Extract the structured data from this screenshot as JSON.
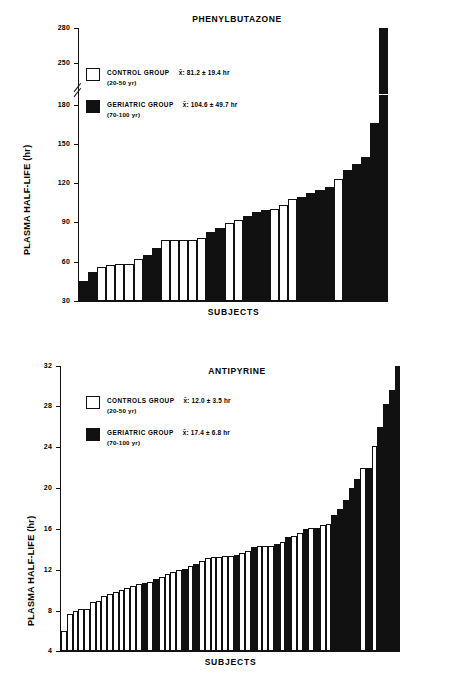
{
  "chart_data": [
    {
      "id": "phenylbutazone",
      "type": "bar",
      "title": "PHENYLBUTAZONE",
      "xlabel": "SUBJECTS",
      "ylabel": "PLASMA HALF-LIFE (hr)",
      "ylim": [
        30,
        280
      ],
      "axis_break": {
        "from": 180,
        "to": 250
      },
      "yticks": [
        30,
        60,
        90,
        120,
        150,
        180,
        250,
        280
      ],
      "ytick_labels": [
        "30",
        "60",
        "90",
        "120",
        "150",
        "180",
        "250",
        "280"
      ],
      "grid": false,
      "legend": {
        "position": "upper-left",
        "entries": [
          {
            "key": "control",
            "label": "CONTROL GROUP",
            "stat": "x̄: 81.2  ±  19.4 hr",
            "sub": "(20-50 yr)",
            "color": "#ffffff",
            "mean": 81.2,
            "sd": 19.4,
            "age_range": "20-50 yr"
          },
          {
            "key": "geriatric",
            "label": "GERIATRIC GROUP",
            "stat": "x̄: 104.6  ±  49.7 hr",
            "sub": "(70-100 yr)",
            "color": "#111111",
            "mean": 104.6,
            "sd": 49.7,
            "age_range": "70-100 yr"
          }
        ]
      },
      "bars": [
        {
          "value": 45,
          "group": "geriatric"
        },
        {
          "value": 52,
          "group": "geriatric"
        },
        {
          "value": 56,
          "group": "control"
        },
        {
          "value": 57,
          "group": "control"
        },
        {
          "value": 58,
          "group": "control"
        },
        {
          "value": 58,
          "group": "control"
        },
        {
          "value": 62,
          "group": "control"
        },
        {
          "value": 65,
          "group": "geriatric"
        },
        {
          "value": 70,
          "group": "geriatric"
        },
        {
          "value": 76,
          "group": "control"
        },
        {
          "value": 76,
          "group": "control"
        },
        {
          "value": 76,
          "group": "control"
        },
        {
          "value": 76,
          "group": "control"
        },
        {
          "value": 78,
          "group": "control"
        },
        {
          "value": 82,
          "group": "geriatric"
        },
        {
          "value": 85,
          "group": "geriatric"
        },
        {
          "value": 89,
          "group": "control"
        },
        {
          "value": 91,
          "group": "control"
        },
        {
          "value": 94,
          "group": "geriatric"
        },
        {
          "value": 97,
          "group": "geriatric"
        },
        {
          "value": 99,
          "group": "geriatric"
        },
        {
          "value": 100,
          "group": "control"
        },
        {
          "value": 103,
          "group": "control"
        },
        {
          "value": 107,
          "group": "control"
        },
        {
          "value": 109,
          "group": "geriatric"
        },
        {
          "value": 112,
          "group": "geriatric"
        },
        {
          "value": 114,
          "group": "geriatric"
        },
        {
          "value": 116,
          "group": "geriatric"
        },
        {
          "value": 122,
          "group": "control"
        },
        {
          "value": 129,
          "group": "geriatric"
        },
        {
          "value": 134,
          "group": "geriatric"
        },
        {
          "value": 139,
          "group": "geriatric"
        },
        {
          "value": 165,
          "group": "geriatric"
        },
        {
          "value": 280,
          "group": "geriatric",
          "broken": true
        }
      ]
    },
    {
      "id": "antipyrine",
      "type": "bar",
      "title": "ANTIPYRINE",
      "xlabel": "SUBJECTS",
      "ylabel": "PLASMA HALF-LIFE (hr)",
      "ylim": [
        4,
        32
      ],
      "yticks": [
        4,
        8,
        12,
        16,
        20,
        24,
        28,
        32
      ],
      "ytick_labels": [
        "4",
        "8",
        "12",
        "16",
        "20",
        "24",
        "28",
        "32"
      ],
      "grid": false,
      "legend": {
        "position": "upper-left",
        "entries": [
          {
            "key": "control",
            "label": "CONTROLS GROUP",
            "stat": "x̄: 12.0  ±  3.5 hr",
            "sub": "(20-50 yr)",
            "color": "#ffffff",
            "mean": 12.0,
            "sd": 3.5,
            "age_range": "20-50 yr"
          },
          {
            "key": "geriatric",
            "label": "GERIATRIC GROUP",
            "stat": "x̄: 17.4  ±  6.8 hr",
            "sub": "(70-100 yr)",
            "color": "#111111",
            "mean": 17.4,
            "sd": 6.8,
            "age_range": "70-100 yr"
          }
        ]
      },
      "bars": [
        {
          "value": 6.0,
          "group": "control"
        },
        {
          "value": 7.6,
          "group": "control"
        },
        {
          "value": 7.9,
          "group": "control"
        },
        {
          "value": 8.1,
          "group": "control"
        },
        {
          "value": 8.1,
          "group": "control"
        },
        {
          "value": 8.8,
          "group": "control"
        },
        {
          "value": 8.9,
          "group": "control"
        },
        {
          "value": 9.4,
          "group": "control"
        },
        {
          "value": 9.6,
          "group": "control"
        },
        {
          "value": 9.8,
          "group": "control"
        },
        {
          "value": 10.0,
          "group": "control"
        },
        {
          "value": 10.2,
          "group": "control"
        },
        {
          "value": 10.4,
          "group": "control"
        },
        {
          "value": 10.6,
          "group": "control"
        },
        {
          "value": 10.7,
          "group": "geriatric"
        },
        {
          "value": 10.8,
          "group": "control"
        },
        {
          "value": 11.1,
          "group": "geriatric"
        },
        {
          "value": 11.3,
          "group": "control"
        },
        {
          "value": 11.6,
          "group": "control"
        },
        {
          "value": 11.8,
          "group": "control"
        },
        {
          "value": 12.0,
          "group": "control"
        },
        {
          "value": 12.1,
          "group": "geriatric"
        },
        {
          "value": 12.4,
          "group": "control"
        },
        {
          "value": 12.5,
          "group": "geriatric"
        },
        {
          "value": 12.8,
          "group": "control"
        },
        {
          "value": 13.1,
          "group": "control"
        },
        {
          "value": 13.2,
          "group": "control"
        },
        {
          "value": 13.2,
          "group": "control"
        },
        {
          "value": 13.3,
          "group": "control"
        },
        {
          "value": 13.3,
          "group": "control"
        },
        {
          "value": 13.4,
          "group": "geriatric"
        },
        {
          "value": 13.6,
          "group": "control"
        },
        {
          "value": 13.8,
          "group": "control"
        },
        {
          "value": 14.2,
          "group": "geriatric"
        },
        {
          "value": 14.3,
          "group": "control"
        },
        {
          "value": 14.3,
          "group": "control"
        },
        {
          "value": 14.3,
          "group": "control"
        },
        {
          "value": 14.5,
          "group": "geriatric"
        },
        {
          "value": 14.7,
          "group": "control"
        },
        {
          "value": 15.2,
          "group": "geriatric"
        },
        {
          "value": 15.3,
          "group": "control"
        },
        {
          "value": 15.6,
          "group": "control"
        },
        {
          "value": 16.0,
          "group": "geriatric"
        },
        {
          "value": 16.1,
          "group": "control"
        },
        {
          "value": 16.1,
          "group": "geriatric"
        },
        {
          "value": 16.4,
          "group": "control"
        },
        {
          "value": 16.5,
          "group": "control"
        },
        {
          "value": 17.4,
          "group": "geriatric"
        },
        {
          "value": 18.0,
          "group": "geriatric"
        },
        {
          "value": 18.8,
          "group": "geriatric"
        },
        {
          "value": 20.0,
          "group": "geriatric"
        },
        {
          "value": 20.9,
          "group": "geriatric"
        },
        {
          "value": 22.0,
          "group": "control"
        },
        {
          "value": 22.0,
          "group": "geriatric"
        },
        {
          "value": 24.1,
          "group": "control"
        },
        {
          "value": 26.0,
          "group": "geriatric"
        },
        {
          "value": 28.3,
          "group": "geriatric"
        },
        {
          "value": 29.6,
          "group": "geriatric"
        },
        {
          "value": 32.0,
          "group": "geriatric"
        }
      ]
    }
  ]
}
